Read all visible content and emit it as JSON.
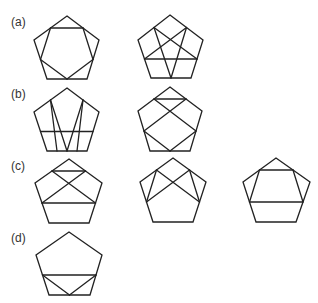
{
  "labels": [
    {
      "text": "(a)",
      "x": 11,
      "y": 16
    },
    {
      "text": "(b)",
      "x": 11,
      "y": 88
    },
    {
      "text": "(c)",
      "x": 11,
      "y": 160
    },
    {
      "text": "(d)",
      "x": 11,
      "y": 232
    }
  ],
  "stroke_color": "#222222",
  "figures": [
    {
      "id": "a1",
      "A": [
        67,
        16
      ],
      "B": [
        99,
        40
      ],
      "C": [
        87,
        79
      ],
      "D": [
        47,
        79
      ],
      "E": [
        34,
        40
      ],
      "lines": [
        [
          "mAB",
          "mBC"
        ],
        [
          "mBC",
          "mCD"
        ],
        [
          "mCD",
          "mDE"
        ],
        [
          "mDE",
          "mEA"
        ],
        [
          "mEA",
          "mAB"
        ]
      ]
    },
    {
      "id": "a2",
      "A": [
        170,
        15
      ],
      "B": [
        203,
        40
      ],
      "C": [
        191,
        78
      ],
      "D": [
        151,
        78
      ],
      "E": [
        138,
        40
      ],
      "lines": [
        [
          "mEA",
          "mCD"
        ],
        [
          "mCD",
          "mAB"
        ],
        [
          "mAB",
          "mDE"
        ],
        [
          "mDE",
          "mBC"
        ],
        [
          "mBC",
          "mEA"
        ]
      ]
    },
    {
      "id": "b1",
      "A": [
        67,
        88
      ],
      "B": [
        99,
        112
      ],
      "C": [
        87,
        151
      ],
      "D": [
        47,
        151
      ],
      "E": [
        34,
        112
      ],
      "lines": [
        [
          "mEA",
          "qD"
        ],
        [
          "mEA",
          "mCD"
        ],
        [
          "mAB",
          "mCD"
        ],
        [
          "mAB",
          "qC"
        ],
        [
          "mDE",
          "mBC"
        ]
      ]
    },
    {
      "id": "b2",
      "A": [
        170,
        87
      ],
      "B": [
        202,
        111
      ],
      "C": [
        190,
        151
      ],
      "D": [
        150,
        151
      ],
      "E": [
        138,
        111
      ],
      "lines": [
        [
          "mEA",
          "mAB"
        ],
        [
          "mEA",
          "mBC"
        ],
        [
          "mAB",
          "mDE"
        ],
        [
          "mDE",
          "mCD"
        ],
        [
          "mCD",
          "mBC"
        ]
      ]
    },
    {
      "id": "c1",
      "A": [
        69,
        159
      ],
      "B": [
        102,
        183
      ],
      "C": [
        89,
        223
      ],
      "D": [
        49,
        223
      ],
      "E": [
        35,
        183
      ],
      "lines": [
        [
          "mEA",
          "mAB"
        ],
        [
          "mEA",
          "mBC"
        ],
        [
          "mAB",
          "mDE"
        ],
        [
          "mDE",
          "mBC"
        ]
      ]
    },
    {
      "id": "c2",
      "A": [
        173,
        158
      ],
      "B": [
        206,
        182
      ],
      "C": [
        193,
        222
      ],
      "D": [
        153,
        222
      ],
      "E": [
        140,
        182
      ],
      "lines": [
        [
          "mEA",
          "mDE"
        ],
        [
          "mEA",
          "mBC"
        ],
        [
          "mAB",
          "mDE"
        ],
        [
          "mAB",
          "mBC"
        ]
      ]
    },
    {
      "id": "c3",
      "A": [
        276,
        158
      ],
      "B": [
        310,
        182
      ],
      "C": [
        296,
        222
      ],
      "D": [
        256,
        222
      ],
      "E": [
        243,
        182
      ],
      "lines": [
        [
          "mEA",
          "mAB"
        ],
        [
          "mEA",
          "mDE"
        ],
        [
          "mAB",
          "mBC"
        ],
        [
          "mDE",
          "mBC"
        ]
      ]
    },
    {
      "id": "d",
      "A": [
        69,
        232
      ],
      "B": [
        102,
        255
      ],
      "C": [
        90,
        295
      ],
      "D": [
        49,
        295
      ],
      "E": [
        36,
        255
      ],
      "lines": [
        [
          "mDE",
          "mBC"
        ],
        [
          "mDE",
          "mCD"
        ],
        [
          "mCD",
          "mBC"
        ]
      ]
    }
  ]
}
